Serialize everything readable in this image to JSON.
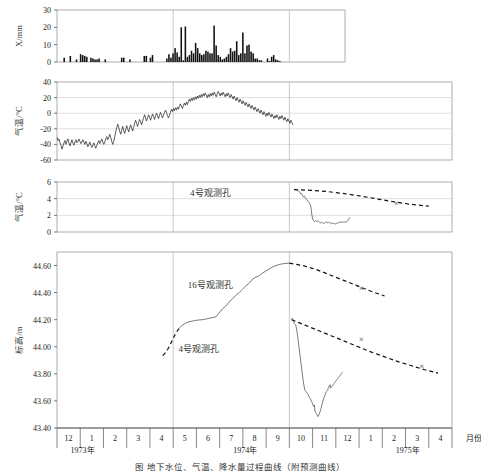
{
  "figure": {
    "caption": "图 地下水位、气温、降水量过程曲线（附预测曲线）",
    "xaxis": {
      "title": "月份",
      "months": [
        "12",
        "1",
        "2",
        "3",
        "4",
        "5",
        "6",
        "7",
        "8",
        "9",
        "10",
        "11",
        "12",
        "1",
        "2",
        "3",
        "4"
      ],
      "years": [
        {
          "label": "1973年",
          "at_month_index": 0
        },
        {
          "label": "1974年",
          "at_month_index": 7
        },
        {
          "label": "1975年",
          "at_month_index": 14
        }
      ],
      "reference_lines": [
        5,
        10
      ]
    },
    "annotations": {
      "panel3_well": "4号观测孔",
      "panel4_well_16": "16号观测孔",
      "panel4_well_4": "4号观测孔"
    }
  },
  "chart_data": [
    {
      "id": "precipitation",
      "type": "bar",
      "title": "",
      "ylabel": "X/mm",
      "xlabel": "",
      "ylim": [
        0,
        30
      ],
      "yticks": [
        0,
        10,
        20,
        30
      ],
      "ytick_labels": [
        "0",
        "10",
        "20",
        "30"
      ],
      "grid": false,
      "x_start_month": 12,
      "x_end_month": 9,
      "values": [
        0,
        0,
        0,
        2.5,
        0,
        0,
        3.5,
        0,
        0,
        1.5,
        0,
        4.5,
        4,
        3.5,
        3,
        0,
        2.5,
        2,
        1.5,
        1.5,
        2,
        0,
        0,
        1.5,
        0,
        0,
        0,
        0,
        0,
        0,
        0,
        2.5,
        2.5,
        0,
        0,
        1.5,
        0,
        0,
        0,
        0,
        0,
        0,
        3.5,
        3.5,
        0,
        2.5,
        4,
        0,
        0,
        0,
        0,
        0,
        0,
        2,
        4.5,
        2.5,
        5,
        8,
        5.5,
        3,
        20,
        1,
        20.5,
        3,
        4,
        6.5,
        5,
        11,
        8,
        5,
        4,
        4.5,
        6.5,
        6,
        5,
        5,
        21,
        9.5,
        4,
        3,
        1.5,
        2,
        3,
        4.5,
        8,
        6,
        6.5,
        12,
        4,
        5,
        17,
        5,
        9.5,
        10,
        6,
        5,
        2,
        2,
        1,
        1,
        0,
        0,
        2,
        0.5,
        3,
        4,
        1.5,
        1,
        0.5,
        0,
        0,
        0
      ]
    },
    {
      "id": "air-temperature",
      "type": "line",
      "title": "",
      "ylabel": "气温/°C",
      "xlabel": "",
      "ylim": [
        -60,
        40
      ],
      "yticks": [
        -60,
        -40,
        -20,
        0,
        20,
        40
      ],
      "ytick_labels": [
        "-60",
        "-40",
        "-20",
        "0",
        "20",
        "40"
      ],
      "grid": true,
      "x_start_month": 12,
      "x_end_month": 10,
      "values": [
        -31,
        -35,
        -33,
        -38,
        -41,
        -46,
        -42,
        -38,
        -35,
        -40,
        -36,
        -33,
        -38,
        -42,
        -38,
        -34,
        -38,
        -41,
        -37,
        -34,
        -38,
        -36,
        -33,
        -36,
        -39,
        -37,
        -34,
        -37,
        -40,
        -36,
        -39,
        -43,
        -40,
        -37,
        -41,
        -44,
        -41,
        -38,
        -42,
        -45,
        -41,
        -38,
        -35,
        -39,
        -36,
        -33,
        -37,
        -40,
        -37,
        -33,
        -30,
        -34,
        -31,
        -27,
        -31,
        -36,
        -40,
        -36,
        -30,
        -24,
        -19,
        -14,
        -18,
        -23,
        -27,
        -22,
        -17,
        -22,
        -26,
        -21,
        -16,
        -20,
        -24,
        -19,
        -15,
        -19,
        -23,
        -18,
        -13,
        -9,
        -13,
        -17,
        -12,
        -8,
        -11,
        -15,
        -10,
        -6,
        -2,
        -6,
        -10,
        -6,
        -2,
        -5,
        -9,
        -5,
        -1,
        -4,
        -8,
        -4,
        0,
        -3,
        -7,
        -3,
        1,
        -2,
        -6,
        -3,
        1,
        4,
        1,
        -3,
        -6,
        -3,
        1,
        5,
        2,
        6,
        3,
        7,
        4,
        8,
        5,
        9,
        12,
        9,
        6,
        10,
        13,
        10,
        14,
        11,
        15,
        18,
        15,
        19,
        16,
        20,
        17,
        21,
        18,
        22,
        19,
        23,
        20,
        24,
        21,
        25,
        22,
        26,
        23,
        20,
        24,
        21,
        25,
        22,
        26,
        23,
        27,
        24,
        21,
        25,
        28,
        25,
        22,
        26,
        23,
        27,
        24,
        21,
        25,
        22,
        26,
        23,
        20,
        24,
        21,
        18,
        22,
        19,
        16,
        20,
        17,
        14,
        18,
        15,
        12,
        16,
        13,
        10,
        14,
        11,
        8,
        12,
        9,
        6,
        10,
        7,
        4,
        8,
        5,
        2,
        6,
        3,
        0,
        4,
        1,
        -2,
        2,
        -1,
        -4,
        0,
        -3,
        1,
        -2,
        -5,
        -1,
        -4,
        -7,
        -3,
        -6,
        -2,
        -5,
        -8,
        -4,
        -7,
        -3,
        -6,
        -9,
        -5,
        -8,
        -11,
        -7,
        -10,
        -13,
        -9,
        -12,
        -15
      ]
    },
    {
      "id": "ground-temperature",
      "type": "line",
      "title": "",
      "ylabel": "气温/°C",
      "xlabel": "",
      "ylim": [
        0,
        6
      ],
      "yticks": [
        0,
        2,
        4,
        6
      ],
      "ytick_labels": [
        "0",
        "2",
        "4",
        "6"
      ],
      "grid": true,
      "series": [
        {
          "name": "4号观测孔",
          "style": "solid",
          "x_start_month": 12.6,
          "x_end_month": 10.2,
          "values": [
            1.75,
            1.6,
            1.45,
            1.35,
            1.3,
            1.25,
            1.22,
            1.2,
            1.2,
            1.2,
            1.2,
            1.2,
            1.2,
            1.2,
            1.2,
            1.2,
            1.18,
            1.15,
            1.12,
            1.1,
            1.08,
            1.05,
            1.0,
            0.95,
            1.0,
            1.08,
            1.02,
            0.98,
            1.05,
            1.12,
            1.05,
            1.0,
            1.05,
            1.12,
            1.2,
            1.15,
            1.1,
            1.15,
            1.25,
            1.18,
            1.1,
            1.05,
            1.0,
            1.05,
            1.12,
            1.18,
            1.12,
            1.08,
            1.12,
            1.2,
            1.25,
            1.3,
            1.28,
            1.25,
            1.3,
            1.38,
            1.3,
            1.25,
            1.3,
            1.4,
            1.6,
            2.0,
            2.6,
            3.1,
            3.3,
            3.45,
            3.55,
            3.65,
            3.75,
            3.85,
            3.95,
            4.05,
            4.15,
            4.3,
            4.25,
            4.2,
            4.35,
            4.5,
            4.6,
            4.55,
            4.7,
            4.8,
            4.9,
            4.95,
            5.0,
            5.05,
            5.08,
            5.1,
            5.12,
            5.1,
            5.08
          ]
        },
        {
          "name": "4号观测孔预测",
          "style": "dashed",
          "x_start_month": 10.2,
          "x_end_month": 16.0,
          "values": [
            5.08,
            5.0,
            4.85,
            4.6,
            4.3,
            3.95,
            3.6,
            3.3,
            3.1
          ],
          "markers": [
            {
              "x_month": 14.6,
              "y": 3.45,
              "symbol": "×"
            }
          ]
        }
      ]
    },
    {
      "id": "water-level",
      "type": "line",
      "title": "",
      "ylabel": "标高/m",
      "xlabel": "",
      "ylim": [
        43.4,
        44.7
      ],
      "yticks": [
        43.4,
        43.6,
        43.8,
        44.0,
        44.2,
        44.4,
        44.6
      ],
      "ytick_labels": [
        "43.40",
        "43.60",
        "43.80",
        "44.00",
        "44.20",
        "44.40",
        "44.60"
      ],
      "grid": false,
      "series": [
        {
          "name": "16号观测孔",
          "style": "dashed",
          "segment": "rise",
          "x_start_month": 4.55,
          "x_end_month": 5.25,
          "values": [
            43.935,
            43.96,
            44.0,
            44.05,
            44.1,
            44.135
          ]
        },
        {
          "name": "16号观测孔",
          "style": "solid",
          "x_start_month": 5.25,
          "x_end_month": 10.0,
          "values": [
            44.135,
            44.16,
            44.175,
            44.185,
            44.19,
            44.195,
            44.198,
            44.2,
            44.205,
            44.21,
            44.215,
            44.22,
            44.25,
            44.28,
            44.3,
            44.33,
            44.355,
            44.38,
            44.4,
            44.425,
            44.45,
            44.47,
            44.5,
            44.515,
            44.525,
            44.545,
            44.56,
            44.575,
            44.59,
            44.6,
            44.608,
            44.613,
            44.616,
            44.618
          ]
        },
        {
          "name": "16号观测孔预测",
          "style": "dashed",
          "x_start_month": 10.0,
          "x_end_month": 14.1,
          "values": [
            44.618,
            44.6,
            44.57,
            44.53,
            44.49,
            44.45,
            44.41,
            44.375
          ],
          "markers": [
            {
              "x_month": 13.1,
              "y": 44.435,
              "symbol": "×"
            }
          ]
        },
        {
          "name": "4号观测孔",
          "style": "solid",
          "x_start_month": 12.3,
          "x_end_month": 10.1,
          "values": [
            43.815,
            43.81,
            43.805,
            43.8,
            43.795,
            43.79,
            43.785,
            43.78,
            43.775,
            43.77,
            43.765,
            43.76,
            43.755,
            43.75,
            43.745,
            43.74,
            43.735,
            43.73,
            43.725,
            43.72,
            43.715,
            43.71,
            43.705,
            43.7,
            43.695,
            43.72,
            43.715,
            43.71,
            43.7,
            43.69,
            43.68,
            43.675,
            43.67,
            43.665,
            43.655,
            43.645,
            43.635,
            43.625,
            43.615,
            43.605,
            43.59,
            43.575,
            43.56,
            43.545,
            43.53,
            43.52,
            43.51,
            43.5,
            43.49,
            43.485,
            43.49,
            43.5,
            43.505,
            43.51,
            43.515,
            43.52,
            43.57,
            43.565,
            43.56,
            43.575,
            43.585,
            43.59,
            43.6,
            43.605,
            43.615,
            43.62,
            43.625,
            43.635,
            43.645,
            43.65,
            43.655,
            43.66,
            43.665,
            43.67,
            43.675,
            43.68,
            43.7,
            43.72,
            43.745,
            43.77,
            43.8,
            43.83,
            43.86,
            43.89,
            43.92,
            43.95,
            43.98,
            44.01,
            44.04,
            44.07,
            44.1,
            44.125,
            44.145,
            44.16,
            44.165,
            44.17,
            44.175,
            44.185,
            44.195,
            44.205,
            44.21,
            44.2
          ]
        },
        {
          "name": "4号观测孔预测",
          "style": "dashed",
          "x_start_month": 10.1,
          "x_end_month": 16.4,
          "values": [
            44.2,
            44.16,
            44.12,
            44.08,
            44.04,
            44.0,
            43.96,
            43.925,
            43.89,
            43.86,
            43.83,
            43.805
          ],
          "markers": [
            {
              "x_month": 13.1,
              "y": 44.055,
              "symbol": "×"
            },
            {
              "x_month": 15.7,
              "y": 43.855,
              "symbol": "×"
            }
          ]
        }
      ]
    }
  ]
}
